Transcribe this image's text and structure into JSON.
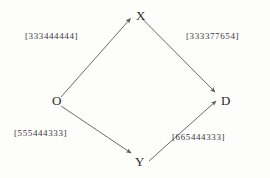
{
  "diagram": {
    "type": "commutative-diamond",
    "background_color": "#fdfdfc",
    "stroke_color": "#5a5a5a",
    "text_color": "#2a2a2a",
    "nodes": [
      {
        "id": "O",
        "label": "O",
        "x": 52,
        "y": 101
      },
      {
        "id": "X",
        "label": "X",
        "x": 136,
        "y": 16
      },
      {
        "id": "Y",
        "label": "Y",
        "x": 135,
        "y": 162
      },
      {
        "id": "D",
        "label": "D",
        "x": 221,
        "y": 101
      }
    ],
    "edges": [
      {
        "id": "o-to-x",
        "from": "O",
        "to": "X",
        "label": "[333444444]",
        "label_x": 25,
        "label_y": 32
      },
      {
        "id": "x-to-d",
        "from": "X",
        "to": "D",
        "label": "[333377654]",
        "label_x": 186,
        "label_y": 32
      },
      {
        "id": "o-to-y",
        "from": "O",
        "to": "Y",
        "label": "[555444333]",
        "label_x": 14,
        "label_y": 129
      },
      {
        "id": "y-to-d",
        "from": "Y",
        "to": "D",
        "label": "[665444333]",
        "label_x": 172,
        "label_y": 133
      }
    ]
  }
}
